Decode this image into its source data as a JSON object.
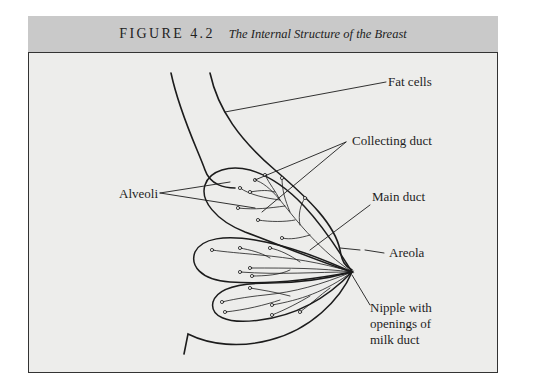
{
  "figure": {
    "number": "FIGURE 4.2",
    "title": "The Internal Structure of the Breast",
    "header_bg": "#c9c9c9",
    "body_bg": "#ededeb"
  },
  "labels": {
    "fat_cells": "Fat cells",
    "collecting_duct": "Collecting duct",
    "alveoli": "Alveoli",
    "main_duct": "Main duct",
    "areola": "Areola",
    "nipple_line1": "Nipple with",
    "nipple_line2": "openings of",
    "nipple_line3": "milk duct"
  }
}
